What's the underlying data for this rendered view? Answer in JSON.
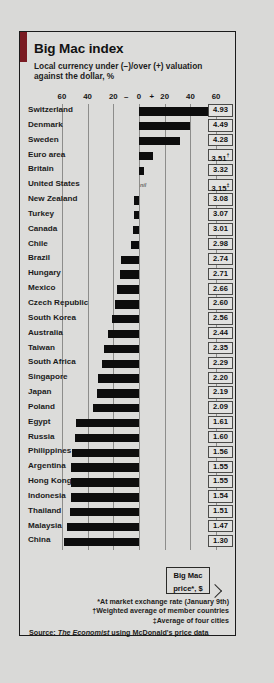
{
  "card": {
    "title": "Big Mac index",
    "subtitle": "Local currency under (−)/over (+) valuation against the dollar, %",
    "accent_color": "#7a1b22",
    "bar_color": "#0d0d0d",
    "background_color": "#dcdcda"
  },
  "callout": {
    "line1": "Big Mac",
    "line2": "price*, $"
  },
  "footnotes": [
    "*At market exchange rate (January 9th)",
    "†Weighted average of member countries",
    "‡Average of four cities"
  ],
  "source": {
    "prefix": "Source: ",
    "publication": "The Economist",
    "suffix": " using McDonald's price data"
  },
  "chart_data": {
    "type": "bar",
    "orientation": "horizontal",
    "title": "Big Mac index",
    "subtitle": "Local currency under (−)/over (+) valuation against the dollar, %",
    "xlabel": "",
    "ylabel": "",
    "xlim": [
      -70,
      70
    ],
    "grid": true,
    "legend": false,
    "axis_tick_labels": [
      "60",
      "40",
      "20",
      "–",
      "0",
      "+",
      "20",
      "40",
      "60"
    ],
    "axis_tick_values": [
      -60,
      -40,
      -20,
      -10,
      0,
      10,
      20,
      40,
      60
    ],
    "gridline_values": [
      -60,
      -40,
      -20,
      0,
      20,
      40,
      60
    ],
    "value_column_header": "Big Mac price*, $",
    "categories": [
      "Switzerland",
      "Denmark",
      "Sweden",
      "Euro area",
      "Britain",
      "United States",
      "New Zealand",
      "Turkey",
      "Canada",
      "Chile",
      "Brazil",
      "Hungary",
      "Mexico",
      "Czech Republic",
      "South Korea",
      "Australia",
      "Taiwan",
      "South Africa",
      "Singapore",
      "Japan",
      "Poland",
      "Egypt",
      "Russia",
      "Philippines",
      "Argentina",
      "Hong Kong",
      "Indonesia",
      "Thailand",
      "Malaysia",
      "China"
    ],
    "values": [
      62,
      40,
      32,
      11,
      4,
      0,
      -4,
      -4,
      -5,
      -6,
      -14,
      -15,
      -17,
      -19,
      -21,
      -24,
      -27,
      -29,
      -32,
      -33,
      -36,
      -49,
      -50,
      -52,
      -53,
      -53,
      -53,
      -54,
      -56,
      -58
    ],
    "series": [
      {
        "name": "Valuation against the dollar, %",
        "values": [
          62,
          40,
          32,
          11,
          4,
          0,
          -4,
          -4,
          -5,
          -6,
          -14,
          -15,
          -17,
          -19,
          -21,
          -24,
          -27,
          -29,
          -32,
          -33,
          -36,
          -49,
          -50,
          -52,
          -53,
          -53,
          -53,
          -54,
          -56,
          -58
        ]
      }
    ],
    "price_labels": [
      "4.93",
      "4.49",
      "4.28",
      "3.51",
      "3.32",
      "3.15",
      "3.08",
      "3.07",
      "3.01",
      "2.98",
      "2.74",
      "2.71",
      "2.66",
      "2.60",
      "2.56",
      "2.44",
      "2.35",
      "2.29",
      "2.20",
      "2.19",
      "2.09",
      "1.61",
      "1.60",
      "1.56",
      "1.55",
      "1.55",
      "1.54",
      "1.51",
      "1.47",
      "1.30"
    ],
    "price_markers": [
      "",
      "",
      "",
      "†",
      "",
      "‡",
      "",
      "",
      "",
      "",
      "",
      "",
      "",
      "",
      "",
      "",
      "",
      "",
      "",
      "",
      "",
      "",
      "",
      "",
      "",
      "",
      "",
      "",
      "",
      ""
    ],
    "annotations": [
      {
        "label": "nil",
        "category": "United States",
        "value": 0
      }
    ],
    "rows": [
      {
        "country": "Switzerland",
        "valuation": 62,
        "price": "4.93",
        "marker": ""
      },
      {
        "country": "Denmark",
        "valuation": 40,
        "price": "4.49",
        "marker": ""
      },
      {
        "country": "Sweden",
        "valuation": 32,
        "price": "4.28",
        "marker": ""
      },
      {
        "country": "Euro area",
        "valuation": 11,
        "price": "3.51",
        "marker": "†"
      },
      {
        "country": "Britain",
        "valuation": 4,
        "price": "3.32",
        "marker": ""
      },
      {
        "country": "United States",
        "valuation": 0,
        "price": "3.15",
        "marker": "‡",
        "note": "nil"
      },
      {
        "country": "New Zealand",
        "valuation": -4,
        "price": "3.08",
        "marker": ""
      },
      {
        "country": "Turkey",
        "valuation": -4,
        "price": "3.07",
        "marker": ""
      },
      {
        "country": "Canada",
        "valuation": -5,
        "price": "3.01",
        "marker": ""
      },
      {
        "country": "Chile",
        "valuation": -6,
        "price": "2.98",
        "marker": ""
      },
      {
        "country": "Brazil",
        "valuation": -14,
        "price": "2.74",
        "marker": ""
      },
      {
        "country": "Hungary",
        "valuation": -15,
        "price": "2.71",
        "marker": ""
      },
      {
        "country": "Mexico",
        "valuation": -17,
        "price": "2.66",
        "marker": ""
      },
      {
        "country": "Czech Republic",
        "valuation": -19,
        "price": "2.60",
        "marker": ""
      },
      {
        "country": "South Korea",
        "valuation": -21,
        "price": "2.56",
        "marker": ""
      },
      {
        "country": "Australia",
        "valuation": -24,
        "price": "2.44",
        "marker": ""
      },
      {
        "country": "Taiwan",
        "valuation": -27,
        "price": "2.35",
        "marker": ""
      },
      {
        "country": "South Africa",
        "valuation": -29,
        "price": "2.29",
        "marker": ""
      },
      {
        "country": "Singapore",
        "valuation": -32,
        "price": "2.20",
        "marker": ""
      },
      {
        "country": "Japan",
        "valuation": -33,
        "price": "2.19",
        "marker": ""
      },
      {
        "country": "Poland",
        "valuation": -36,
        "price": "2.09",
        "marker": ""
      },
      {
        "country": "Egypt",
        "valuation": -49,
        "price": "1.61",
        "marker": ""
      },
      {
        "country": "Russia",
        "valuation": -50,
        "price": "1.60",
        "marker": ""
      },
      {
        "country": "Philippines",
        "valuation": -52,
        "price": "1.56",
        "marker": ""
      },
      {
        "country": "Argentina",
        "valuation": -53,
        "price": "1.55",
        "marker": ""
      },
      {
        "country": "Hong Kong",
        "valuation": -53,
        "price": "1.55",
        "marker": ""
      },
      {
        "country": "Indonesia",
        "valuation": -53,
        "price": "1.54",
        "marker": ""
      },
      {
        "country": "Thailand",
        "valuation": -54,
        "price": "1.51",
        "marker": ""
      },
      {
        "country": "Malaysia",
        "valuation": -56,
        "price": "1.47",
        "marker": ""
      },
      {
        "country": "China",
        "valuation": -58,
        "price": "1.30",
        "marker": ""
      }
    ]
  }
}
